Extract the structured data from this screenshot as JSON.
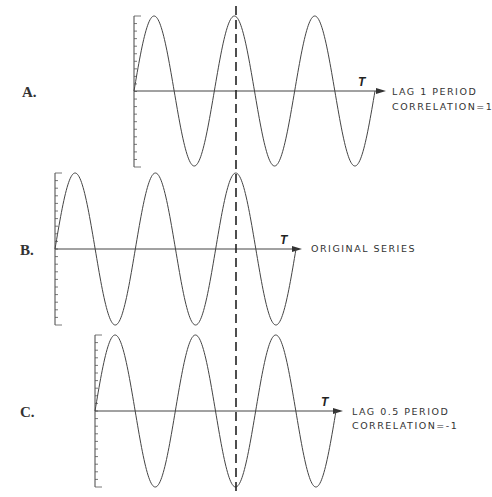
{
  "chart_data": {
    "type": "line",
    "title": "",
    "shared_dashed_reference_line": true,
    "panels": [
      {
        "id": "A",
        "label": "A.",
        "axis_label": "T",
        "annotation_lines": [
          "LAG 1 PERIOD",
          "CORRELATION=1"
        ],
        "series": {
          "name": "Lag 1 period",
          "function": "sine",
          "periods": 3,
          "phase_shift_periods": 1
        },
        "grid": false
      },
      {
        "id": "B",
        "label": "B.",
        "axis_label": "T",
        "annotation_lines": [
          "ORIGINAL SERIES"
        ],
        "series": {
          "name": "Original series",
          "function": "sine",
          "periods": 3,
          "phase_shift_periods": 0
        },
        "grid": false
      },
      {
        "id": "C",
        "label": "C.",
        "axis_label": "T",
        "annotation_lines": [
          "LAG 0.5 PERIOD",
          "CORRELATION=-1"
        ],
        "series": {
          "name": "Lag 0.5 period",
          "function": "sine",
          "periods": 3,
          "phase_shift_periods": 0.5
        },
        "grid": false
      }
    ]
  },
  "panels": {
    "A": {
      "label": "A.",
      "t": "T",
      "line1": "LAG 1 PERIOD",
      "line2": "CORRELATION=1"
    },
    "B": {
      "label": "B.",
      "t": "T",
      "line1": "ORIGINAL SERIES"
    },
    "C": {
      "label": "C.",
      "t": "T",
      "line1": "LAG 0.5 PERIOD",
      "line2": "CORRELATION=-1"
    }
  },
  "colors": {
    "ink": "#333333",
    "background": "#ffffff"
  }
}
